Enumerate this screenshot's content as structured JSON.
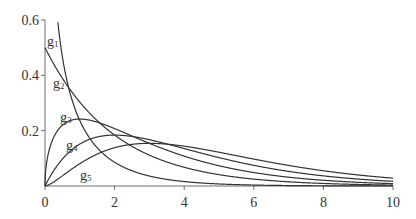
{
  "chart_data": {
    "type": "line",
    "title": "",
    "xlabel": "",
    "ylabel": "",
    "xlim": [
      0,
      10
    ],
    "ylim": [
      0,
      0.6
    ],
    "x_ticks": [
      0,
      2,
      4,
      6,
      8,
      10
    ],
    "x_tick_labels": [
      "0",
      "2",
      "4",
      "6",
      "8",
      "10"
    ],
    "y_ticks": [
      0.2,
      0.4,
      0.6
    ],
    "y_tick_labels": [
      "0.2",
      "0.4",
      "0.6"
    ],
    "grid": false,
    "legend": "inline labels near curves (left)",
    "series": [
      {
        "name": "g1",
        "label_base": "g",
        "label_sub": "1",
        "description": "decreasing, unbounded near 0",
        "x": [
          0.3,
          0.4,
          0.5,
          0.66,
          1,
          1.5,
          2,
          3,
          4,
          5,
          6,
          8,
          10
        ],
        "y": [
          0.6,
          0.56,
          0.49,
          0.36,
          0.28,
          0.18,
          0.12,
          0.06,
          0.03,
          0.015,
          0.008,
          0.003,
          0.001
        ]
      },
      {
        "name": "g2",
        "label_base": "g",
        "label_sub": "2",
        "x": [
          0,
          0.5,
          1,
          2,
          3,
          4,
          5,
          6,
          8,
          10
        ],
        "y": [
          0.5,
          0.39,
          0.303,
          0.184,
          0.112,
          0.068,
          0.041,
          0.025,
          0.009,
          0.003
        ]
      },
      {
        "name": "g3",
        "label_base": "g",
        "label_sub": "3",
        "x": [
          0,
          0.25,
          0.5,
          1,
          2,
          3,
          4,
          5,
          6,
          8,
          10
        ],
        "y": [
          0,
          0.199,
          0.235,
          0.242,
          0.208,
          0.154,
          0.108,
          0.073,
          0.049,
          0.021,
          0.009
        ]
      },
      {
        "name": "g4",
        "label_base": "g",
        "label_sub": "4",
        "x": [
          0,
          0.5,
          1,
          2,
          3,
          4,
          5,
          6,
          8,
          10
        ],
        "y": [
          0,
          0.097,
          0.152,
          0.184,
          0.167,
          0.135,
          0.103,
          0.075,
          0.037,
          0.017
        ]
      },
      {
        "name": "g5",
        "label_base": "g",
        "label_sub": "5",
        "x": [
          0,
          0.5,
          1,
          2,
          3,
          4,
          5,
          6,
          8,
          10
        ],
        "y": [
          0,
          0.041,
          0.081,
          0.138,
          0.154,
          0.144,
          0.122,
          0.097,
          0.054,
          0.028
        ]
      }
    ]
  }
}
